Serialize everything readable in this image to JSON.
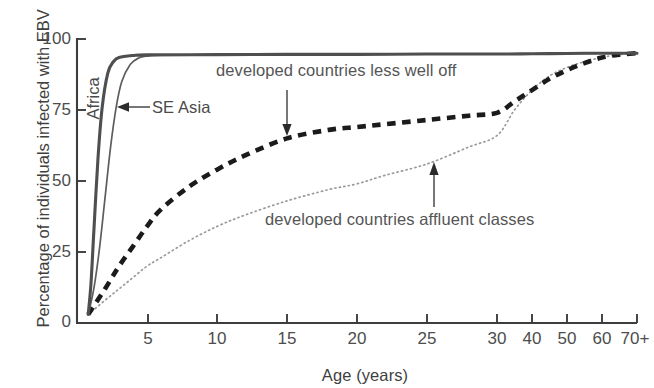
{
  "chart_data": {
    "type": "line",
    "title": "",
    "xlabel": "Age (years)",
    "ylabel": "Percentage of individuals infected with EBV",
    "xtick_labels": [
      "5",
      "10",
      "15",
      "20",
      "25",
      "30",
      "40",
      "50",
      "60",
      "70+"
    ],
    "xtick_values": [
      5,
      10,
      15,
      20,
      25,
      30,
      40,
      50,
      60,
      70
    ],
    "ytick_labels": [
      "0",
      "25",
      "50",
      "75",
      "100"
    ],
    "ytick_values": [
      0,
      25,
      50,
      75,
      100
    ],
    "ylim": [
      0,
      100
    ],
    "xlim": [
      0,
      70
    ],
    "grid": false,
    "legend_position": "inline-annotations",
    "series": [
      {
        "name": "Africa",
        "style": "solid-thick",
        "color": "#4a4a4a",
        "x": [
          0.8,
          1.0,
          1.2,
          1.5,
          1.8,
          2.2,
          2.6,
          3.0,
          4.0,
          5.0,
          10,
          15,
          20,
          25,
          30,
          40,
          50,
          60,
          70
        ],
        "y": [
          3,
          14,
          32,
          58,
          76,
          88,
          92,
          93.5,
          94.2,
          94.4,
          94.5,
          94.6,
          94.6,
          94.7,
          94.7,
          94.8,
          94.9,
          95.0,
          95.0
        ]
      },
      {
        "name": "SE Asia",
        "style": "solid-thin",
        "color": "#5a5a5a",
        "x": [
          0.8,
          1.2,
          1.6,
          2.0,
          2.4,
          2.8,
          3.2,
          3.8,
          4.4,
          5.0,
          6.0,
          10,
          15,
          20,
          25,
          30,
          40,
          50,
          60,
          70
        ],
        "y": [
          3,
          12,
          26,
          44,
          62,
          76,
          85,
          91,
          93.3,
          94.0,
          94.3,
          94.5,
          94.6,
          94.6,
          94.7,
          94.7,
          94.8,
          94.9,
          95.0,
          95.0
        ]
      },
      {
        "name": "developed countries less well off",
        "style": "dashed",
        "color": "#1a1a1a",
        "x": [
          0.8,
          2,
          3,
          4,
          5,
          6,
          8,
          10,
          12,
          15,
          18,
          20,
          22,
          25,
          28,
          30,
          35,
          40,
          45,
          50,
          55,
          60,
          65,
          70
        ],
        "y": [
          3,
          12,
          20,
          27,
          34,
          40,
          48,
          54,
          59,
          65,
          68,
          69,
          70,
          71.5,
          73,
          74,
          78,
          82,
          86,
          89,
          91.5,
          93.5,
          94.5,
          95
        ]
      },
      {
        "name": "developed countries affluent classes",
        "style": "dotted",
        "color": "#8e8e8e",
        "x": [
          0.8,
          2,
          3,
          4,
          5,
          6,
          8,
          10,
          12,
          15,
          18,
          20,
          22,
          25,
          28,
          30,
          35,
          40,
          45,
          50,
          55,
          60,
          65,
          70
        ],
        "y": [
          3,
          8,
          12,
          16,
          20,
          23,
          29,
          34,
          38,
          43,
          47,
          49,
          52,
          56,
          62,
          66,
          75,
          82,
          87,
          90,
          92,
          93.5,
          94.5,
          95
        ]
      }
    ],
    "annotations": [
      {
        "text": "developed countries less well off",
        "target_series": "developed countries less well off",
        "target_x": 15,
        "target_y": 65,
        "arrow": "down"
      },
      {
        "text": "developed countries affluent classes",
        "target_series": "developed countries affluent classes",
        "target_x": 25,
        "target_y": 56,
        "arrow": "up"
      },
      {
        "text": "Africa",
        "target_series": "Africa",
        "arrow": "none",
        "orientation": "vertical"
      },
      {
        "text": "SE Asia",
        "target_series": "SE Asia",
        "arrow": "left"
      }
    ]
  },
  "axes": {
    "x_title": "Age (years)",
    "y_title": "Percentage of individuals infected with EBV",
    "x_ticks": [
      {
        "label": "5"
      },
      {
        "label": "10"
      },
      {
        "label": "15"
      },
      {
        "label": "20"
      },
      {
        "label": "25"
      },
      {
        "label": "30"
      },
      {
        "label": "40"
      },
      {
        "label": "50"
      },
      {
        "label": "60"
      },
      {
        "label": "70+"
      }
    ],
    "y_ticks": [
      {
        "label": "100"
      },
      {
        "label": "75"
      },
      {
        "label": "50"
      },
      {
        "label": "25"
      },
      {
        "label": "0"
      }
    ]
  },
  "labels": {
    "africa": "Africa",
    "se_asia": "SE Asia",
    "less_well_off": "developed countries less well off",
    "affluent": "developed countries affluent classes"
  },
  "colors": {
    "africa_line": "#4a4a4a",
    "se_asia_line": "#5a5a5a",
    "less_well_off_line": "#1a1a1a",
    "affluent_line": "#8e8e8e",
    "axis": "#3d3d3d",
    "text": "#4a4a4a",
    "background": "#ffffff"
  }
}
